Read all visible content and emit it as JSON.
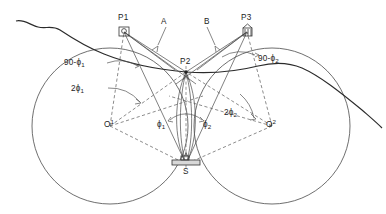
{
  "figure": {
    "type": "geometric-survey-diagram",
    "background_color": "#ffffff",
    "line_color": "#4a4a4a",
    "coastline_color": "#2b2b2b"
  },
  "points": {
    "p1": {
      "label": "P1",
      "x": 124,
      "y": 30,
      "icon": "station-square-icon"
    },
    "p2": {
      "label": "P2",
      "x": 186,
      "y": 72,
      "icon": "node-dot-icon"
    },
    "p3": {
      "label": "P3",
      "x": 247,
      "y": 30,
      "icon": "station-tower-icon"
    },
    "o1": {
      "label": "O",
      "superscript": "1",
      "x": 110,
      "y": 126
    },
    "o2": {
      "label": "O",
      "superscript": "2",
      "x": 272,
      "y": 126
    },
    "s": {
      "label": "S",
      "x": 186,
      "y": 164,
      "icon": "ship-icon"
    }
  },
  "annotations": {
    "a_label": {
      "text": "A",
      "x": 163,
      "y": 22
    },
    "b_label": {
      "text": "B",
      "x": 207,
      "y": 22
    },
    "ninety_minus_phi1": {
      "prefix": "90-",
      "symbol": "ϕ",
      "subscript": "1",
      "x": 67,
      "y": 62
    },
    "ninety_minus_phi2": {
      "prefix": "90-",
      "symbol": "ϕ",
      "subscript": "2",
      "x": 264,
      "y": 58
    },
    "two_phi1": {
      "prefix": "2",
      "symbol": "ϕ",
      "subscript": "1",
      "x": 74,
      "y": 88
    },
    "two_phi2": {
      "prefix": "2",
      "symbol": "ϕ",
      "subscript": "2",
      "x": 228,
      "y": 112
    },
    "phi1": {
      "symbol": "ϕ",
      "subscript": "1",
      "x": 160,
      "y": 124
    },
    "phi2": {
      "symbol": "ϕ",
      "subscript": "2",
      "x": 204,
      "y": 124
    }
  },
  "labels": {
    "p1": "P1",
    "p2": "P2",
    "p3": "P3",
    "o1_base": "O",
    "o1_sup": "1",
    "o2_base": "O",
    "o2_sup": "2",
    "s": "S",
    "a": "A",
    "b": "B",
    "ninety_minus_phi1_text": "90-ϕ",
    "ninety_minus_phi1_sub": "1",
    "ninety_minus_phi2_text": "90-ϕ",
    "ninety_minus_phi2_sub": "2",
    "two_phi1_text": "2ϕ",
    "two_phi1_sub": "1",
    "two_phi2_text": "2ϕ",
    "two_phi2_sub": "2",
    "phi1_text": "ϕ",
    "phi1_sub": "1",
    "phi2_text": "ϕ",
    "phi2_sub": "2"
  }
}
